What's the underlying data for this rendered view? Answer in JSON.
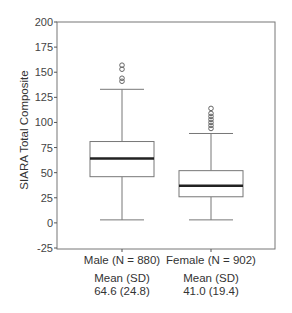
{
  "chart_data": {
    "type": "box",
    "title": "",
    "xlabel": "",
    "ylabel": "SIARA Total Composite",
    "ylim": [
      -25,
      200
    ],
    "yticks": [
      -25,
      0,
      25,
      50,
      75,
      100,
      125,
      150,
      175,
      200
    ],
    "grid": false,
    "categories": [
      "Male (N = 880)",
      "Female (N = 902)"
    ],
    "series": [
      {
        "name": "Male",
        "n": 880,
        "whisker_low": 3,
        "q1": 46,
        "median": 64,
        "q3": 81,
        "whisker_high": 133,
        "outliers": [
          141,
          144,
          153,
          157
        ],
        "mean": 64.6,
        "sd": 24.8
      },
      {
        "name": "Female",
        "n": 902,
        "whisker_low": 3,
        "q1": 26,
        "median": 37,
        "q3": 52,
        "whisker_high": 89,
        "outliers": [
          94,
          97,
          100,
          103,
          106,
          109,
          114
        ],
        "mean": 41.0,
        "sd": 19.4
      }
    ],
    "annotations": [
      {
        "group": "Male",
        "line1": "Mean (SD)",
        "line2": "64.6 (24.8)"
      },
      {
        "group": "Female",
        "line1": "Mean (SD)",
        "line2": "41.0 (19.4)"
      }
    ]
  },
  "labels": {
    "ylabel": "SIARA Total Composite",
    "male_cat": "Male (N = 880)",
    "female_cat": "Female (N = 902)",
    "male_stat_head": "Mean (SD)",
    "male_stat_val": "64.6 (24.8)",
    "female_stat_head": "Mean (SD)",
    "female_stat_val": "41.0 (19.4)"
  }
}
